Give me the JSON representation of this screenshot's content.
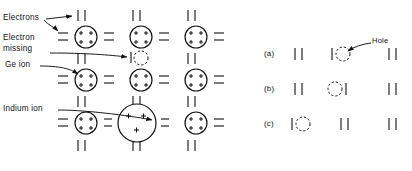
{
  "figure": {
    "kind": "semiconductor-lattice-diagram",
    "background": "#ffffff",
    "ink": "#111111"
  },
  "labels": {
    "electrons": "Electrons",
    "electron_missing_line1": "Electron",
    "electron_missing_line2": "missing",
    "ge_ion": "Ge ion",
    "indium_ion": "Indium ion",
    "hole": "Hole",
    "case_a": "(a)",
    "case_b": "(b)",
    "case_c": "(c)"
  },
  "symbols": {
    "ge_core_charge": "+",
    "ge_core_charge_count": 4,
    "indium_core_charge": "+",
    "indium_core_charge_count": 3,
    "bond_pair": "| |",
    "bond_horizontal": "=",
    "hole_marker": "dashed-circle",
    "single_electron": "|"
  },
  "left_lattice": {
    "title_note": "germanium lattice with one missing bond electron and an indium acceptor ion",
    "columns": 3,
    "rows": 3,
    "atoms": [
      {
        "row": 0,
        "col": 0,
        "type": "ge",
        "charges": 4
      },
      {
        "row": 0,
        "col": 1,
        "type": "ge",
        "charges": 4
      },
      {
        "row": 0,
        "col": 2,
        "type": "ge",
        "charges": 4
      },
      {
        "row": 1,
        "col": 0,
        "type": "ge",
        "charges": 4
      },
      {
        "row": 1,
        "col": 1,
        "type": "ge",
        "charges": 4
      },
      {
        "row": 1,
        "col": 2,
        "type": "ge",
        "charges": 4
      },
      {
        "row": 2,
        "col": 0,
        "type": "ge",
        "charges": 4
      },
      {
        "row": 2,
        "col": 1,
        "type": "indium",
        "charges": 3
      },
      {
        "row": 2,
        "col": 2,
        "type": "ge",
        "charges": 4
      }
    ],
    "missing_electron_site": {
      "between_rows": "0-1",
      "col": 1,
      "note": "one electron present, one missing (dashed circle)"
    }
  },
  "hole_sequence": {
    "rows": [
      {
        "case": "(a)",
        "cells": [
          "pair",
          "hole-right",
          "pair"
        ],
        "hole_position": 1,
        "hole_side": "right",
        "annotated": true
      },
      {
        "case": "(b)",
        "cells": [
          "pair",
          "hole-left",
          "pair"
        ],
        "hole_position": 1,
        "hole_side": "left",
        "annotated": false
      },
      {
        "case": "(c)",
        "cells": [
          "hole-right",
          "pair",
          "pair"
        ],
        "hole_position": 0,
        "hole_side": "right",
        "annotated": false
      }
    ]
  }
}
